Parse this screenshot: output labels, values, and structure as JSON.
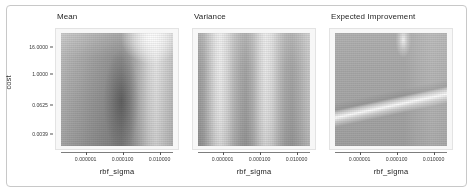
{
  "figure": {
    "y_axis_title": "cost",
    "x_axis_title": "rbf_sigma"
  },
  "chart_data": {
    "type": "heatmap",
    "title": "",
    "panels": [
      {
        "title": "Mean",
        "xlabel": "rbf_sigma",
        "ylabel": "cost",
        "xticklabels": [
          "0.000001",
          "0.000100",
          "0.010000"
        ],
        "xtick_positions": [
          0.22,
          0.55,
          0.88
        ],
        "yticklabels": [
          "16.0000",
          "1.0000",
          "0.0625",
          "0.0039"
        ],
        "ytick_positions": [
          0.12,
          0.36,
          0.63,
          0.89
        ],
        "xscale": "log",
        "yscale": "log",
        "colormap": "grayscale",
        "description": "Dark vertical band near mid-right of sigma range; bright high-value region at top-right; smooth left-to-right falloff.",
        "value_range": [
          0.0,
          1.0
        ],
        "grid": false
      },
      {
        "title": "Variance",
        "xlabel": "rbf_sigma",
        "ylabel": "cost",
        "xticklabels": [
          "0.000001",
          "0.000100",
          "0.010000"
        ],
        "xtick_positions": [
          0.22,
          0.55,
          0.88
        ],
        "yticklabels": [
          "16.0000",
          "1.0000",
          "0.0625",
          "0.0039"
        ],
        "ytick_positions": [
          0.12,
          0.36,
          0.63,
          0.89
        ],
        "xscale": "log",
        "yscale": "log",
        "colormap": "grayscale",
        "description": "Alternating bright and dark vertical bands across sigma; nearly constant along cost.",
        "value_range": [
          0.0,
          1.0
        ],
        "grid": false
      },
      {
        "title": "Expected Improvement",
        "xlabel": "rbf_sigma",
        "ylabel": "cost",
        "xticklabels": [
          "0.000001",
          "0.000100",
          "0.010000"
        ],
        "xtick_positions": [
          0.22,
          0.55,
          0.88
        ],
        "yticklabels": [
          "16.0000",
          "1.0000",
          "0.0625",
          "0.0039"
        ],
        "ytick_positions": [
          0.12,
          0.36,
          0.63,
          0.89
        ],
        "xscale": "log",
        "yscale": "log",
        "colormap": "grayscale",
        "description": "Flat mid-gray field with a narrow bright curved ridge sweeping from top-center toward lower-right.",
        "value_range": [
          0.0,
          1.0
        ],
        "grid": false
      }
    ]
  }
}
